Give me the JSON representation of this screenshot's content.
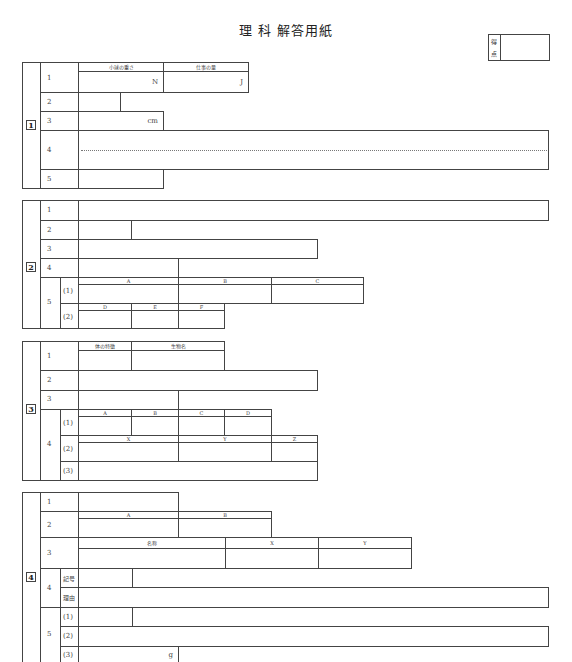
{
  "title": "理 科  解答用紙",
  "score_box": {
    "label_top": "得",
    "label_bottom": "点"
  },
  "sections": {
    "s1": {
      "number": "1",
      "rows": [
        "1",
        "2",
        "3",
        "4",
        "5"
      ],
      "q1_headers": [
        "小球の重さ",
        "仕事の量"
      ],
      "q1_units": [
        "N",
        "J"
      ],
      "q3_unit": "cm"
    },
    "s2": {
      "number": "2",
      "rows": [
        "1",
        "2",
        "3",
        "4",
        "5"
      ],
      "q5_subs": [
        "(1)",
        "(2)"
      ],
      "q5_1_headers": [
        "A",
        "B",
        "C"
      ],
      "q5_2_headers": [
        "D",
        "E",
        "F"
      ]
    },
    "s3": {
      "number": "3",
      "rows": [
        "1",
        "2",
        "3",
        "4"
      ],
      "q1_headers": [
        "体の特徴",
        "生物名"
      ],
      "q4_subs": [
        "(1)",
        "(2)",
        "(3)"
      ],
      "q4_1_headers": [
        "A",
        "B",
        "C",
        "D"
      ],
      "q4_2_headers": [
        "X",
        "Y",
        "Z"
      ]
    },
    "s4": {
      "number": "4",
      "rows": [
        "1",
        "2",
        "3",
        "4",
        "5"
      ],
      "q2_headers": [
        "A",
        "B"
      ],
      "q3_headers": [
        "名称",
        "X",
        "Y"
      ],
      "q4_subs": [
        "記号",
        "理由"
      ],
      "q5_subs": [
        "(1)",
        "(2)",
        "(3)"
      ],
      "q5_3_unit": "g"
    }
  }
}
